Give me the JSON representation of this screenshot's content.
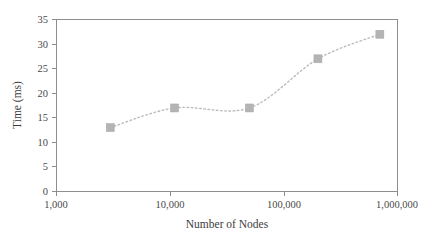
{
  "chart_data": {
    "type": "line",
    "title": "",
    "xlabel": "Number of Nodes",
    "ylabel": "Time (ms)",
    "xscale": "log",
    "xlim": [
      1000,
      1000000
    ],
    "ylim": [
      0,
      35
    ],
    "grid": false,
    "legend": null,
    "xticks": [
      1000,
      10000,
      100000,
      1000000
    ],
    "xticklabels": [
      "1,000",
      "10,000",
      "100,000",
      "1,000,000"
    ],
    "yticks": [
      0,
      5,
      10,
      15,
      20,
      25,
      30,
      35
    ],
    "yticklabels": [
      "0",
      "5",
      "10",
      "15",
      "20",
      "25",
      "30",
      "35"
    ],
    "marker": "square",
    "linestyle": "dotted",
    "color": "#b4b4b4",
    "x": [
      3000,
      11000,
      50000,
      200000,
      700000
    ],
    "values": [
      13,
      17,
      17,
      27,
      32
    ],
    "points": [
      {
        "x": 3000,
        "y": 13
      },
      {
        "x": 11000,
        "y": 17
      },
      {
        "x": 50000,
        "y": 17
      },
      {
        "x": 200000,
        "y": 27
      },
      {
        "x": 700000,
        "y": 32
      }
    ]
  },
  "axes": {
    "y_title": "Time (ms)",
    "x_title": "Number of Nodes"
  },
  "ticks": {
    "y": [
      "35",
      "30",
      "25",
      "20",
      "15",
      "10",
      "5",
      "0"
    ],
    "x": [
      "1,000",
      "10,000",
      "100,000",
      "1,000,000"
    ]
  }
}
